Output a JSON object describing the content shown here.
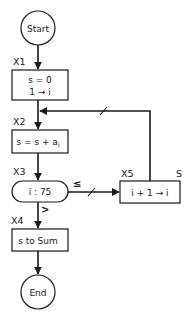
{
  "diagram": {
    "type": "flowchart",
    "nodes": {
      "start": {
        "label": "Start",
        "shape": "circle"
      },
      "x1": {
        "step": "X1",
        "lines": [
          "s = 0",
          "1 → i"
        ],
        "shape": "rectangle"
      },
      "x2": {
        "step": "X2",
        "text_main": "s = s + a",
        "text_sub": "i",
        "shape": "rectangle"
      },
      "x3": {
        "step": "X3",
        "label": "i : 75",
        "shape": "rounded-decision"
      },
      "x4": {
        "step": "X4",
        "label": "s to Sum",
        "shape": "rectangle"
      },
      "x5": {
        "step": "X5",
        "corner_label": "S",
        "label": "i + 1 → i",
        "shape": "rectangle"
      },
      "end": {
        "label": "End",
        "shape": "circle"
      }
    },
    "edges": {
      "le_label": "≤",
      "gt_label": ">"
    },
    "colors": {
      "stroke": "#1a1a1a",
      "background": "#ffffff"
    }
  }
}
